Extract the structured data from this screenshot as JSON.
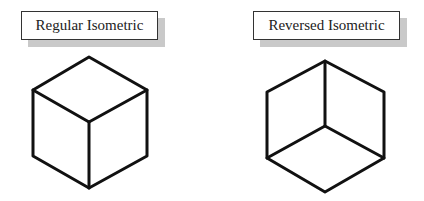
{
  "diagram": {
    "panels": [
      {
        "label": "Regular Isometric",
        "cube": {
          "top": [
            89,
            57
          ],
          "upper_left": [
            33,
            90
          ],
          "upper_right": [
            147,
            90
          ],
          "center": [
            89,
            122
          ],
          "lower_left": [
            33,
            156
          ],
          "lower_right": [
            147,
            156
          ],
          "bottom": [
            89,
            188
          ]
        }
      },
      {
        "label": "Reversed Isometric",
        "cube": {
          "top": [
            325,
            61
          ],
          "upper_left": [
            267,
            92
          ],
          "upper_right": [
            384,
            92
          ],
          "center": [
            325,
            126
          ],
          "lower_left": [
            267,
            158
          ],
          "lower_right": [
            384,
            158
          ],
          "bottom": [
            325,
            192
          ]
        }
      }
    ],
    "colors": {
      "line": "#111111",
      "shadow": "#c9c9c9",
      "background": "#ffffff"
    }
  }
}
